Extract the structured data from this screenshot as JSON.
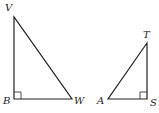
{
  "diagram": {
    "triangles": [
      {
        "name": "triangle-VBW",
        "right_angle_at": "B",
        "vertices": {
          "V": {
            "label": "V",
            "x": 14,
            "y": 17
          },
          "B": {
            "label": "B",
            "x": 14,
            "y": 99
          },
          "W": {
            "label": "W",
            "x": 72,
            "y": 99
          }
        }
      },
      {
        "name": "triangle-TAS",
        "right_angle_at": "S",
        "vertices": {
          "T": {
            "label": "T",
            "x": 147,
            "y": 43
          },
          "A": {
            "label": "A",
            "x": 108,
            "y": 99
          },
          "S": {
            "label": "S",
            "x": 147,
            "y": 99
          }
        }
      }
    ],
    "colors": {
      "stroke": "#222222",
      "background": "#ffffff"
    }
  }
}
